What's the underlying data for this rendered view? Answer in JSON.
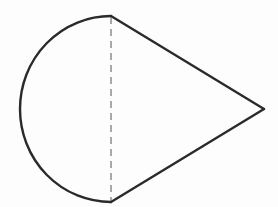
{
  "diagram": {
    "shapes": [
      {
        "name": "semicircle",
        "side": "left",
        "outline": "solid"
      },
      {
        "name": "triangle",
        "side": "right",
        "type": "isosceles",
        "outline": "solid"
      },
      {
        "name": "diameter",
        "orientation": "vertical",
        "outline": "dashed"
      }
    ],
    "labels": [],
    "colors": {
      "stroke": "#2a2a2a",
      "dashed_stroke": "#555555",
      "background": "#fdfdfd"
    }
  }
}
